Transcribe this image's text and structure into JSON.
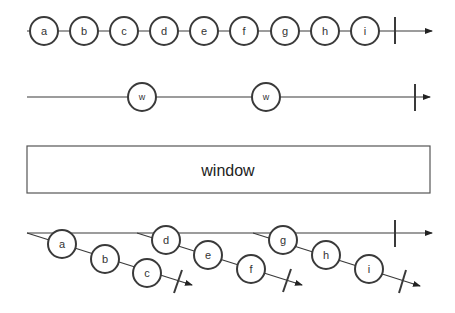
{
  "diagram": {
    "type": "marble-diagram",
    "operator": "window",
    "source_stream": {
      "items": [
        "a",
        "b",
        "c",
        "d",
        "e",
        "f",
        "g",
        "h",
        "i"
      ],
      "completed": true
    },
    "boundary_stream": {
      "items": [
        "w",
        "w"
      ],
      "completed": true
    },
    "operator_box": {
      "label": "window"
    },
    "output_stream": {
      "completed": true,
      "windows": [
        {
          "items": [
            "a",
            "b",
            "c"
          ],
          "completed": true
        },
        {
          "items": [
            "d",
            "e",
            "f"
          ],
          "completed": true
        },
        {
          "items": [
            "g",
            "h",
            "i"
          ],
          "completed": true
        }
      ]
    }
  }
}
